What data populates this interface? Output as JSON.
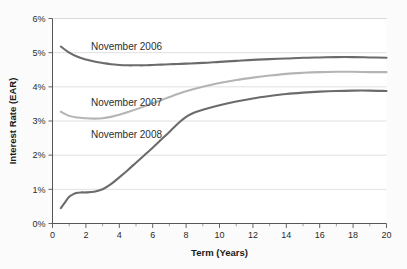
{
  "chart_data": {
    "type": "line",
    "title": "",
    "xlabel": "Term (Years)",
    "ylabel": "Interest Rate (EAR)",
    "xlim": [
      0,
      20
    ],
    "ylim": [
      0,
      6
    ],
    "grid": true,
    "legend_position": "inline-annotations",
    "x_tick_labels": [
      "0",
      "2",
      "4",
      "6",
      "8",
      "10",
      "12",
      "14",
      "16",
      "18",
      "20"
    ],
    "x_ticks": [
      0,
      2,
      4,
      6,
      8,
      10,
      12,
      14,
      16,
      18,
      20
    ],
    "x_minor_ticks": [
      1,
      3,
      5,
      7,
      9,
      11,
      13,
      15,
      17,
      19
    ],
    "y_tick_labels": [
      "0%",
      "1%",
      "2%",
      "3%",
      "4%",
      "5%",
      "6%"
    ],
    "y_ticks": [
      0,
      1,
      2,
      3,
      4,
      5,
      6
    ],
    "series": [
      {
        "name": "November 2006",
        "color": "#6b6b6b",
        "x": [
          0.5,
          1,
          1.5,
          2,
          2.5,
          3,
          3.5,
          4,
          4.5,
          5,
          5.5,
          6,
          6.5,
          7,
          7.5,
          8,
          9,
          10,
          11,
          12,
          13,
          14,
          15,
          16,
          17,
          18,
          19,
          20
        ],
        "values": [
          5.18,
          5.0,
          4.88,
          4.8,
          4.74,
          4.7,
          4.66,
          4.64,
          4.63,
          4.63,
          4.63,
          4.64,
          4.65,
          4.66,
          4.67,
          4.68,
          4.7,
          4.73,
          4.76,
          4.79,
          4.81,
          4.83,
          4.85,
          4.86,
          4.87,
          4.87,
          4.86,
          4.85
        ]
      },
      {
        "name": "November 2007",
        "color": "#b4b4b4",
        "x": [
          0.5,
          1,
          1.5,
          2,
          2.5,
          3,
          3.5,
          4,
          4.5,
          5,
          5.5,
          6,
          6.5,
          7,
          7.5,
          8,
          9,
          10,
          11,
          12,
          13,
          14,
          15,
          16,
          17,
          18,
          19,
          20
        ],
        "values": [
          3.27,
          3.15,
          3.1,
          3.08,
          3.07,
          3.08,
          3.12,
          3.18,
          3.26,
          3.34,
          3.43,
          3.52,
          3.61,
          3.7,
          3.79,
          3.87,
          4.0,
          4.11,
          4.2,
          4.27,
          4.33,
          4.38,
          4.41,
          4.43,
          4.44,
          4.44,
          4.43,
          4.43
        ]
      },
      {
        "name": "November 2008",
        "color": "#6b6b6b",
        "x": [
          0.5,
          0.75,
          1,
          1.25,
          1.5,
          1.75,
          2,
          2.5,
          3,
          3.5,
          4,
          4.5,
          5,
          5.5,
          6,
          6.5,
          7,
          7.5,
          8,
          8.5,
          9,
          10,
          11,
          12,
          13,
          14,
          15,
          16,
          17,
          18,
          19,
          20
        ],
        "values": [
          0.45,
          0.62,
          0.78,
          0.86,
          0.9,
          0.91,
          0.91,
          0.93,
          1.0,
          1.15,
          1.35,
          1.56,
          1.78,
          2.0,
          2.22,
          2.45,
          2.68,
          2.92,
          3.12,
          3.25,
          3.33,
          3.46,
          3.57,
          3.66,
          3.73,
          3.79,
          3.83,
          3.86,
          3.88,
          3.89,
          3.89,
          3.88
        ]
      }
    ],
    "annotations": [
      {
        "text": "November 2006",
        "x_pct": 0.115,
        "y_pct": 0.155
      },
      {
        "text": "November 2007",
        "x_pct": 0.115,
        "y_pct": 0.425
      },
      {
        "text": "November 2008",
        "x_pct": 0.115,
        "y_pct": 0.585
      }
    ]
  },
  "style": {
    "background": "#fbfbfb",
    "plot_background": "#ffffff",
    "gridline_color": "#d8d8d8",
    "axis_color": "#555555",
    "text_color": "#2b2b2b"
  }
}
